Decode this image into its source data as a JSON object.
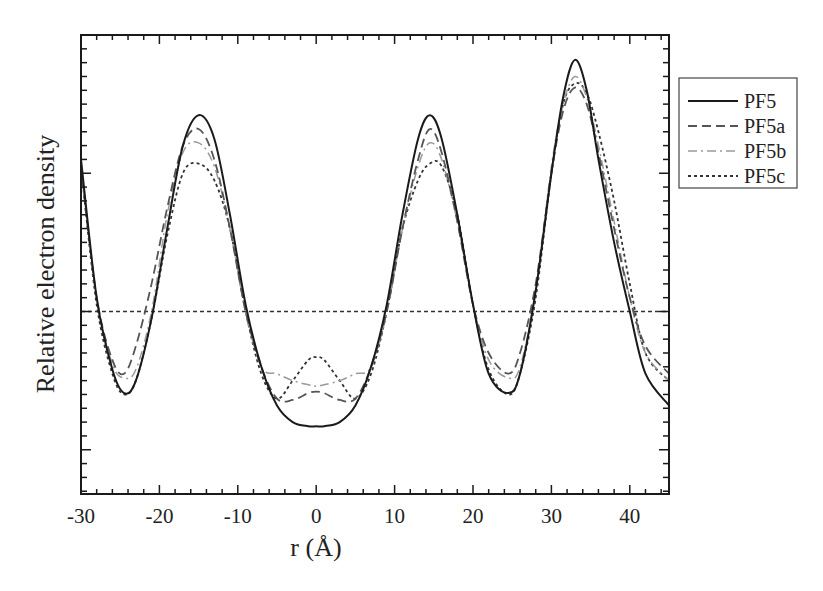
{
  "chart_data": {
    "type": "line",
    "title": "",
    "xlabel": "r (Å)",
    "ylabel": "Relative electron density",
    "xlim": [
      -30,
      45
    ],
    "ylim": [
      -1.32,
      2.0
    ],
    "x_ticks": [
      -30,
      -20,
      -10,
      0,
      10,
      20,
      30,
      40
    ],
    "x_tick_labels": [
      "-30",
      "-20",
      "-10",
      "0",
      "10",
      "20",
      "30",
      "40"
    ],
    "y_tick_labels_shown": false,
    "grid": false,
    "legend_position": "outside-right-top",
    "reference_line": {
      "y": 0,
      "style": "dotted",
      "label": "PF5c reference level"
    },
    "series": [
      {
        "name": "PF5",
        "style": "solid",
        "color": "#1a1a1a",
        "x": [
          -30,
          -28,
          -26,
          -24.5,
          -23,
          -21,
          -19,
          -17,
          -15,
          -13,
          -11,
          -9,
          -7,
          -5,
          -3,
          -1,
          0,
          1,
          3,
          5,
          7,
          9,
          11,
          13,
          14.5,
          16,
          18,
          20,
          22,
          24.5,
          26,
          28,
          30,
          31.5,
          33,
          34.5,
          36,
          38,
          40,
          42,
          45
        ],
        "values": [
          1.1,
          0.1,
          -0.42,
          -0.59,
          -0.5,
          -0.05,
          0.6,
          1.2,
          1.42,
          1.25,
          0.7,
          0.05,
          -0.4,
          -0.68,
          -0.8,
          -0.83,
          -0.83,
          -0.83,
          -0.8,
          -0.68,
          -0.4,
          0.05,
          0.7,
          1.25,
          1.42,
          1.25,
          0.7,
          0.05,
          -0.45,
          -0.59,
          -0.45,
          0.15,
          1.0,
          1.55,
          1.82,
          1.6,
          1.1,
          0.5,
          0.0,
          -0.45,
          -0.68
        ]
      },
      {
        "name": "PF5a",
        "style": "dashed",
        "color": "#555555",
        "x": [
          -30,
          -28,
          -26,
          -24.5,
          -23,
          -21,
          -19,
          -17,
          -15,
          -13,
          -11,
          -9,
          -7,
          -5,
          -3,
          -1,
          0,
          1,
          3,
          5,
          7,
          9,
          11,
          13,
          14.5,
          16,
          18,
          20,
          22,
          24.5,
          26,
          28,
          30,
          31.5,
          33,
          34.5,
          36,
          38,
          40,
          42,
          45
        ],
        "values": [
          1.05,
          0.1,
          -0.35,
          -0.45,
          -0.25,
          0.2,
          0.75,
          1.2,
          1.32,
          1.1,
          0.6,
          0.0,
          -0.4,
          -0.63,
          -0.64,
          -0.59,
          -0.58,
          -0.59,
          -0.64,
          -0.63,
          -0.4,
          0.0,
          0.6,
          1.1,
          1.32,
          1.15,
          0.65,
          0.05,
          -0.3,
          -0.45,
          -0.3,
          0.2,
          1.0,
          1.45,
          1.62,
          1.5,
          1.15,
          0.6,
          0.1,
          -0.25,
          -0.45
        ]
      },
      {
        "name": "PF5b",
        "style": "dash-dot",
        "color": "#9a9a9a",
        "x": [
          -30,
          -28,
          -26,
          -24.5,
          -23,
          -21,
          -19,
          -17,
          -15,
          -13,
          -11,
          -9,
          -7,
          -5,
          -3,
          -1,
          0,
          1,
          3,
          5,
          7,
          9,
          11,
          13,
          14.5,
          16,
          18,
          20,
          22,
          24.5,
          26,
          28,
          30,
          31.5,
          33,
          34.5,
          36,
          38,
          40,
          42,
          45
        ],
        "values": [
          1.05,
          0.1,
          -0.38,
          -0.48,
          -0.42,
          0.0,
          0.7,
          1.15,
          1.22,
          1.05,
          0.6,
          0.0,
          -0.4,
          -0.45,
          -0.5,
          -0.53,
          -0.54,
          -0.53,
          -0.5,
          -0.45,
          -0.4,
          0.0,
          0.6,
          1.05,
          1.22,
          1.1,
          0.65,
          0.05,
          -0.35,
          -0.48,
          -0.4,
          0.15,
          1.05,
          1.5,
          1.7,
          1.55,
          1.2,
          0.65,
          0.1,
          -0.3,
          -0.5
        ]
      },
      {
        "name": "PF5c",
        "style": "dotted",
        "color": "#333333",
        "x": [
          -30,
          -28,
          -26,
          -24.5,
          -23,
          -21,
          -19,
          -17,
          -15,
          -13,
          -11,
          -9,
          -7,
          -5,
          -3,
          -1,
          0,
          1,
          3,
          5,
          7,
          9,
          11,
          13,
          14.5,
          16,
          18,
          20,
          22,
          24.5,
          26,
          28,
          30,
          31.5,
          33,
          34.5,
          36,
          38,
          40,
          42,
          45
        ],
        "values": [
          1.05,
          0.05,
          -0.45,
          -0.6,
          -0.5,
          -0.05,
          0.55,
          1.0,
          1.07,
          0.95,
          0.6,
          0.0,
          -0.45,
          -0.63,
          -0.5,
          -0.35,
          -0.33,
          -0.35,
          -0.5,
          -0.63,
          -0.45,
          0.0,
          0.6,
          0.95,
          1.07,
          1.05,
          0.7,
          0.05,
          -0.42,
          -0.6,
          -0.45,
          0.1,
          1.0,
          1.5,
          1.65,
          1.58,
          1.3,
          0.8,
          0.2,
          -0.3,
          -0.5
        ]
      }
    ]
  },
  "legend": {
    "items": [
      {
        "label": "PF5",
        "style": "solid"
      },
      {
        "label": "PF5a",
        "style": "dashed"
      },
      {
        "label": "PF5b",
        "style": "dash-dot"
      },
      {
        "label": "PF5c",
        "style": "dotted"
      }
    ]
  },
  "axes": {
    "xlabel": "r (Å)",
    "ylabel": "Relative electron density"
  }
}
